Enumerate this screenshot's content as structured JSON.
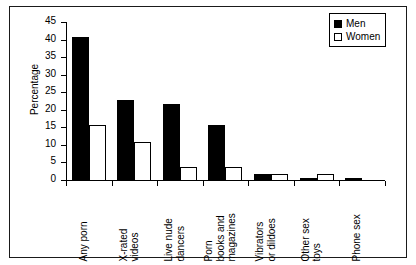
{
  "chart_data": {
    "type": "bar",
    "title": "",
    "xlabel": "",
    "ylabel": "Percentage",
    "ylim": [
      0,
      45
    ],
    "ytick_step": 5,
    "yticks": [
      0,
      5,
      10,
      15,
      20,
      25,
      30,
      35,
      40,
      45
    ],
    "grid": false,
    "legend_position": "top-right",
    "categories": [
      "Any porn",
      "X-rated videos",
      "Live nude dancers",
      "Porn books and magazines",
      "Vibrators or dildoes",
      "Other sex toys",
      "Phone sex"
    ],
    "category_lines": [
      [
        "Any porn"
      ],
      [
        "X-rated",
        "videos"
      ],
      [
        "Live nude",
        "dancers"
      ],
      [
        "Porn",
        "books and",
        "magazines"
      ],
      [
        "Vibrators",
        "or dildoes"
      ],
      [
        "Other sex",
        "toys"
      ],
      [
        "Phone sex"
      ]
    ],
    "series": [
      {
        "name": "Men",
        "color": "#000000",
        "fill": "solid",
        "values": [
          41,
          23,
          22,
          16,
          2,
          1,
          1
        ]
      },
      {
        "name": "Women",
        "color": "#ffffff",
        "fill": "hollow",
        "values": [
          16,
          11,
          4,
          4,
          2,
          2,
          0
        ]
      }
    ]
  },
  "legend": {
    "entries": [
      {
        "label": "Men"
      },
      {
        "label": "Women"
      }
    ]
  },
  "axes": {
    "y_title": "Percentage"
  }
}
